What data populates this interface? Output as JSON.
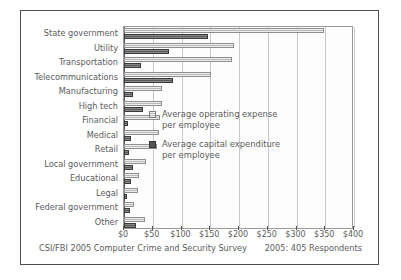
{
  "title_strip": "",
  "chart_data": {
    "type": "bar",
    "orientation": "horizontal",
    "title": "",
    "xlabel": "",
    "ylabel": "",
    "xlim": [
      0,
      400
    ],
    "xticks": [
      "$0",
      "$50",
      "$100",
      "$150",
      "$200",
      "$250",
      "$300",
      "$350",
      "$400"
    ],
    "xtick_values": [
      0,
      50,
      100,
      150,
      200,
      250,
      300,
      350,
      400
    ],
    "grid": true,
    "legend_position": "center-right-inside",
    "categories": [
      "State government",
      "Utility",
      "Transportation",
      "Telecommunications",
      "Manufacturing",
      "High tech",
      "Financial",
      "Medical",
      "Retail",
      "Local government",
      "Educational",
      "Legal",
      "Federal government",
      "Other"
    ],
    "series": [
      {
        "name": "Average operating expense per employee",
        "color": "#b9b9b9",
        "values": [
          348,
          191,
          188,
          152,
          66,
          66,
          63,
          60,
          57,
          38,
          26,
          24,
          17,
          36
        ]
      },
      {
        "name": "Average capital expenditure per employee",
        "color": "#5a5a5a",
        "values": [
          146,
          78,
          30,
          86,
          15,
          33,
          7,
          13,
          9,
          15,
          12,
          6,
          11,
          20
        ]
      }
    ]
  },
  "legend": [
    {
      "swatch": "operating-expense-swatch",
      "line1": "Average operating expense",
      "line2": "per employee"
    },
    {
      "swatch": "capital-expenditure-swatch",
      "line1": "Average capital expenditure",
      "line2": "per employee"
    }
  ],
  "footer": {
    "source": "CSI/FBI 2005 Computer Crime and Security Survey",
    "respondents": "2005: 405 Respondents"
  }
}
